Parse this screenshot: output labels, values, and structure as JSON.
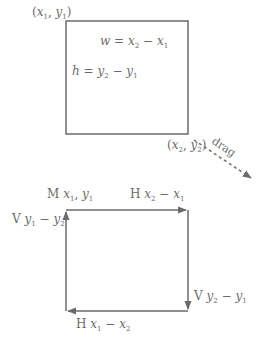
{
  "top": {
    "corner_top_left": {
      "x": "x",
      "y": "y",
      "xs": "1",
      "ys": "1"
    },
    "corner_bottom_right": {
      "x": "x",
      "y": "y",
      "xs": "2",
      "ys": "2"
    },
    "width_label": {
      "lhs": "w",
      "a": "x",
      "as": "2",
      "b": "x",
      "bs": "1"
    },
    "height_label": {
      "lhs": "h",
      "a": "y",
      "as": "2",
      "b": "y",
      "bs": "1"
    },
    "drag_label": "drag"
  },
  "bottom": {
    "move": {
      "cmd": "M",
      "x": "x",
      "xs": "1",
      "y": "y",
      "ys": "1"
    },
    "h_top": {
      "cmd": "H",
      "a": "x",
      "as": "2",
      "b": "x",
      "bs": "1"
    },
    "v_right": {
      "cmd": "V",
      "a": "y",
      "as": "2",
      "b": "y",
      "bs": "1"
    },
    "h_bottom": {
      "cmd": "H",
      "a": "x",
      "as": "1",
      "b": "x",
      "bs": "2"
    },
    "v_left": {
      "cmd": "V",
      "a": "y",
      "as": "1",
      "b": "y",
      "bs": "2"
    }
  },
  "colors": {
    "stroke": "#6b6b6b",
    "text": "#6b6b6b"
  }
}
